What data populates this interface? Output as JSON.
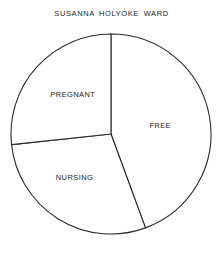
{
  "chart_data": {
    "type": "pie",
    "title": "SUSANNA HOLYOKE WARD",
    "categories": [
      "FREE",
      "NURSING",
      "PREGNANT"
    ],
    "values": [
      44.4,
      28.9,
      26.7
    ],
    "units": "percent (estimated from slice angles)",
    "slices": [
      {
        "label": "FREE",
        "value": 44.4,
        "start_deg": 0,
        "end_deg": 160
      },
      {
        "label": "NURSING",
        "value": 28.9,
        "start_deg": 160,
        "end_deg": 264
      },
      {
        "label": "PREGNANT",
        "value": 26.7,
        "start_deg": 264,
        "end_deg": 360
      }
    ],
    "start_angle": "12 o'clock, clockwise",
    "legend": "none (labels inside slices)",
    "grid": false,
    "colors": {
      "fill": "#ffffff",
      "stroke": "#2a2a2a"
    }
  }
}
